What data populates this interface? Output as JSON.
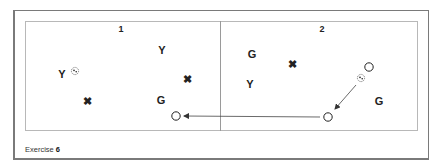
{
  "diagram": {
    "caption": {
      "prefix": "Exercise",
      "number": "6"
    },
    "panels": [
      {
        "label": "1",
        "label_pos": [
          121,
          29
        ],
        "players": [
          {
            "type": "letter",
            "text": "Y",
            "pos": [
              62,
              74
            ]
          },
          {
            "type": "letter",
            "text": "Y",
            "pos": [
              162,
              50
            ]
          },
          {
            "type": "cross",
            "text": "✖",
            "pos": [
              187,
              79
            ]
          },
          {
            "type": "cross",
            "text": "✖",
            "pos": [
              87,
              101
            ]
          },
          {
            "type": "letter",
            "text": "G",
            "pos": [
              161,
              100
            ]
          }
        ],
        "balls": [
          {
            "pos": [
              75,
              71
            ]
          }
        ],
        "cones": [
          {
            "pos": [
              176,
              116
            ]
          }
        ]
      },
      {
        "label": "2",
        "label_pos": [
          322,
          29
        ],
        "players": [
          {
            "type": "letter",
            "text": "G",
            "pos": [
              252,
              54
            ]
          },
          {
            "type": "cross",
            "text": "✖",
            "pos": [
              292,
              64
            ]
          },
          {
            "type": "letter",
            "text": "Y",
            "pos": [
              250,
              84
            ]
          },
          {
            "type": "letter",
            "text": "G",
            "pos": [
              379,
              101
            ]
          }
        ],
        "balls": [
          {
            "pos": [
              361,
              78
            ]
          }
        ],
        "cones": [
          {
            "pos": [
              369,
              67
            ]
          },
          {
            "pos": [
              328,
              117
            ]
          }
        ]
      }
    ],
    "arrows": [
      {
        "from": [
          356,
          85
        ],
        "to": [
          335,
          109
        ],
        "style": "solid"
      },
      {
        "from": [
          320,
          117
        ],
        "to": [
          184,
          116
        ],
        "style": "solid"
      }
    ],
    "colors": {
      "ink": "#222222",
      "frame": "#7a7a7a",
      "field": "#b8b8b8"
    }
  }
}
